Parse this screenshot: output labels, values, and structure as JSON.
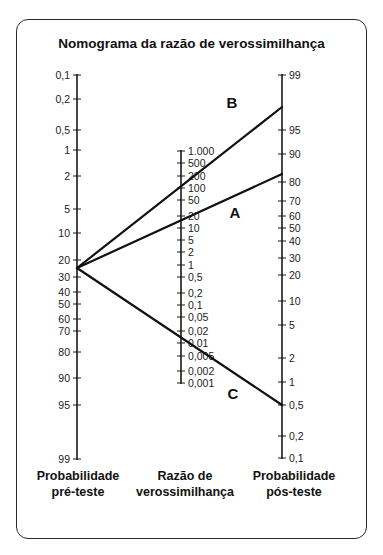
{
  "title": "Nomograma da razão de verossimilhança",
  "axes": {
    "pre_test": {
      "label_line1": "Probabilidade",
      "label_line2": "pré-teste",
      "x": 77,
      "ticks": [
        {
          "label": "0,1",
          "y": 75
        },
        {
          "label": "0,2",
          "y": 99
        },
        {
          "label": "0,5",
          "y": 130
        },
        {
          "label": "1",
          "y": 150
        },
        {
          "label": "2",
          "y": 176
        },
        {
          "label": "5",
          "y": 209
        },
        {
          "label": "10",
          "y": 233
        },
        {
          "label": "20",
          "y": 260
        },
        {
          "label": "30",
          "y": 277
        },
        {
          "label": "40",
          "y": 292
        },
        {
          "label": "50",
          "y": 304
        },
        {
          "label": "60",
          "y": 319
        },
        {
          "label": "70",
          "y": 331
        },
        {
          "label": "80",
          "y": 352
        },
        {
          "label": "90",
          "y": 378
        },
        {
          "label": "95",
          "y": 405
        },
        {
          "label": "99",
          "y": 459
        }
      ]
    },
    "likelihood_ratio": {
      "label_line1": "Razão de",
      "label_line2": "verossimilhança",
      "x": 181,
      "ticks": [
        {
          "label": "1.000",
          "y": 151
        },
        {
          "label": "500",
          "y": 163
        },
        {
          "label": "200",
          "y": 176
        },
        {
          "label": "100",
          "y": 188
        },
        {
          "label": "50",
          "y": 200
        },
        {
          "label": "20",
          "y": 216
        },
        {
          "label": "10",
          "y": 228
        },
        {
          "label": "5",
          "y": 240
        },
        {
          "label": "2",
          "y": 252
        },
        {
          "label": "1",
          "y": 265
        },
        {
          "label": "0,5",
          "y": 277
        },
        {
          "label": "0,2",
          "y": 293
        },
        {
          "label": "0,1",
          "y": 305
        },
        {
          "label": "0,05",
          "y": 317
        },
        {
          "label": "0,02",
          "y": 331
        },
        {
          "label": "0,01",
          "y": 343
        },
        {
          "label": "0,005",
          "y": 356
        },
        {
          "label": "0,002",
          "y": 371
        },
        {
          "label": "0,001",
          "y": 383
        }
      ]
    },
    "post_test": {
      "label_line1": "Probabilidade",
      "label_line2": "pós-teste",
      "x": 282,
      "ticks": [
        {
          "label": "99",
          "y": 75
        },
        {
          "label": "95",
          "y": 130
        },
        {
          "label": "90",
          "y": 154
        },
        {
          "label": "80",
          "y": 182
        },
        {
          "label": "70",
          "y": 201
        },
        {
          "label": "60",
          "y": 216
        },
        {
          "label": "50",
          "y": 228
        },
        {
          "label": "40",
          "y": 241
        },
        {
          "label": "30",
          "y": 258
        },
        {
          "label": "20",
          "y": 275
        },
        {
          "label": "10",
          "y": 301
        },
        {
          "label": "5",
          "y": 325
        },
        {
          "label": "2",
          "y": 358
        },
        {
          "label": "1",
          "y": 382
        },
        {
          "label": "0,5",
          "y": 405
        },
        {
          "label": "0,2",
          "y": 436
        },
        {
          "label": "0,1",
          "y": 458
        }
      ]
    }
  },
  "lines": [
    {
      "name": "B",
      "x1": 77,
      "y1": 268,
      "x2": 282,
      "y2": 107,
      "label_x": 232,
      "label_y": 108
    },
    {
      "name": "A",
      "x1": 77,
      "y1": 268,
      "x2": 282,
      "y2": 174,
      "label_x": 235,
      "label_y": 218
    },
    {
      "name": "C",
      "x1": 77,
      "y1": 268,
      "x2": 282,
      "y2": 405,
      "label_x": 233,
      "label_y": 399
    }
  ],
  "chart_data": {
    "type": "nomogram",
    "title": "Nomograma da razão de verossimilhança",
    "axes": [
      {
        "name": "Probabilidade pré-teste",
        "unit": "%",
        "ticks": [
          "0,1",
          "0,2",
          "0,5",
          "1",
          "2",
          "5",
          "10",
          "20",
          "30",
          "40",
          "50",
          "60",
          "70",
          "80",
          "90",
          "95",
          "99"
        ]
      },
      {
        "name": "Razão de verossimilhança",
        "ticks": [
          "1.000",
          "500",
          "200",
          "100",
          "50",
          "20",
          "10",
          "5",
          "2",
          "1",
          "0,5",
          "0,2",
          "0,1",
          "0,05",
          "0,02",
          "0,01",
          "0,005",
          "0,002",
          "0,001"
        ]
      },
      {
        "name": "Probabilidade pós-teste",
        "unit": "%",
        "ticks": [
          "99",
          "95",
          "90",
          "80",
          "70",
          "60",
          "50",
          "40",
          "30",
          "20",
          "10",
          "5",
          "2",
          "1",
          "0,5",
          "0,2",
          "0,1"
        ]
      }
    ],
    "series": [
      {
        "name": "B",
        "pre_test_probability": 25,
        "likelihood_ratio": 100,
        "post_test_probability": 97
      },
      {
        "name": "A",
        "pre_test_probability": 25,
        "likelihood_ratio": 15,
        "post_test_probability": 83
      },
      {
        "name": "C",
        "pre_test_probability": 25,
        "likelihood_ratio": 0.015,
        "post_test_probability": 0.5
      }
    ]
  }
}
